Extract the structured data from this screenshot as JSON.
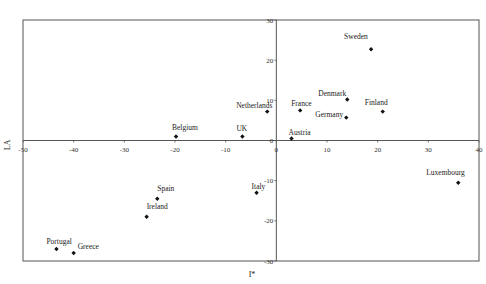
{
  "chart_data": {
    "type": "scatter",
    "title": "",
    "xlabel": "I*",
    "ylabel": "LA",
    "xlim": [
      -50,
      40
    ],
    "ylim": [
      -30,
      30
    ],
    "xticks": [
      -50,
      -40,
      -30,
      -20,
      -10,
      0,
      10,
      20,
      30,
      40
    ],
    "yticks": [
      -30,
      -20,
      -10,
      0,
      10,
      20,
      30
    ],
    "grid": false,
    "legend": null,
    "points": [
      {
        "label": "Sweden",
        "x": 18.7,
        "y": 22.7
      },
      {
        "label": "Denmark",
        "x": 14.0,
        "y": 10.2
      },
      {
        "label": "Finland",
        "x": 21.0,
        "y": 7.2
      },
      {
        "label": "Germany",
        "x": 13.8,
        "y": 5.7
      },
      {
        "label": "France",
        "x": 4.7,
        "y": 7.5
      },
      {
        "label": "Netherlands",
        "x": -1.8,
        "y": 7.2
      },
      {
        "label": "UK",
        "x": -6.7,
        "y": 1.0
      },
      {
        "label": "Belgium",
        "x": -19.8,
        "y": 1.0
      },
      {
        "label": "Austria",
        "x": 3.0,
        "y": 0.5
      },
      {
        "label": "Italy",
        "x": -3.9,
        "y": -13.0
      },
      {
        "label": "Luxembourg",
        "x": 35.9,
        "y": -10.5
      },
      {
        "label": "Spain",
        "x": -23.5,
        "y": -14.5
      },
      {
        "label": "Ireland",
        "x": -25.6,
        "y": -19.0
      },
      {
        "label": "Portugal",
        "x": -43.4,
        "y": -27.0
      },
      {
        "label": "Greece",
        "x": -40.0,
        "y": -28.0
      }
    ]
  },
  "label_offsets": {
    "Sweden": [
      -27,
      -10
    ],
    "Denmark": [
      -29,
      -4
    ],
    "Finland": [
      -18,
      -7
    ],
    "Germany": [
      -31,
      -1
    ],
    "France": [
      -9,
      -4
    ],
    "Netherlands": [
      -31,
      -4
    ],
    "UK": [
      -6,
      -5
    ],
    "Belgium": [
      -4,
      -6
    ],
    "Austria": [
      -3,
      -3
    ],
    "Italy": [
      -5,
      -4
    ],
    "Luxembourg": [
      -32,
      -8
    ],
    "Spain": [
      0,
      -8
    ],
    "Ireland": [
      0,
      -8
    ],
    "Portugal": [
      -10,
      -5
    ],
    "Greece": [
      4,
      -4
    ]
  }
}
